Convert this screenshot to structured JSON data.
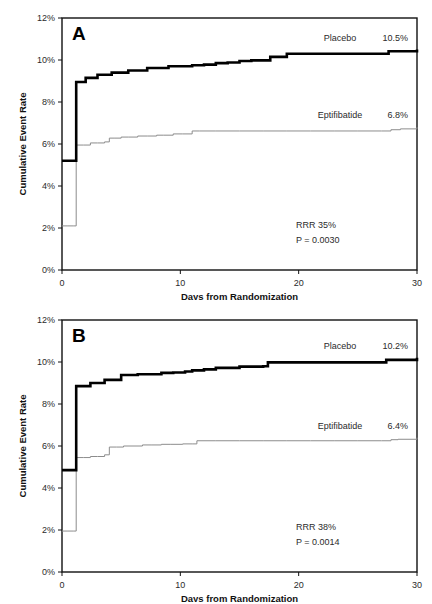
{
  "figure": {
    "axis": {
      "x_label": "Days from Randomization",
      "y_label": "Cumulative Event Rate",
      "x_ticks": [
        "0",
        "10",
        "20",
        "30"
      ],
      "y_ticks": [
        "0%",
        "2%",
        "4%",
        "6%",
        "8%",
        "10%",
        "12%"
      ]
    },
    "colors": {
      "placebo_line": "#000000",
      "eptifibatide_line": "#8c8c8c",
      "frame": "#111111",
      "text": "#2b2b2b"
    },
    "panels": [
      {
        "letter": "A",
        "placebo_label": "Placebo",
        "placebo_value": "10.5%",
        "drug_label": "Eptifibatide",
        "drug_value": "6.8%",
        "rrr": "RRR 35%",
        "pvalue": "P = 0.0030"
      },
      {
        "letter": "B",
        "placebo_label": "Placebo",
        "placebo_value": "10.2%",
        "drug_label": "Eptifibatide",
        "drug_value": "6.4%",
        "rrr": "RRR 38%",
        "pvalue": "P = 0.0014"
      }
    ]
  },
  "chart_data": [
    {
      "type": "line",
      "title": "A",
      "xlabel": "Days from Randomization",
      "ylabel": "Cumulative Event Rate",
      "xlim": [
        0,
        30
      ],
      "ylim": [
        0,
        12
      ],
      "x_ticks": [
        0,
        10,
        20,
        30
      ],
      "y_ticks": [
        0,
        2,
        4,
        6,
        8,
        10,
        12
      ],
      "grid": false,
      "legend_position": "inline-right",
      "annotations": [
        "RRR 35%",
        "P = 0.0030"
      ],
      "series": [
        {
          "name": "Placebo",
          "final_value": 10.5,
          "style": "step-thick-black",
          "x": [
            0,
            0.5,
            1,
            1.2,
            1.6,
            2,
            2.5,
            3,
            3.6,
            4.2,
            5,
            5.6,
            6.4,
            7.2,
            8.2,
            9,
            10,
            11,
            12,
            13,
            14,
            15,
            16,
            17,
            17.6,
            18.4,
            19,
            21,
            23,
            25,
            27,
            27.6,
            29,
            30
          ],
          "y": [
            5.2,
            5.2,
            5.2,
            8.95,
            8.95,
            9.15,
            9.15,
            9.3,
            9.3,
            9.4,
            9.4,
            9.5,
            9.5,
            9.62,
            9.62,
            9.7,
            9.7,
            9.75,
            9.78,
            9.85,
            9.88,
            9.95,
            9.98,
            9.98,
            10.15,
            10.15,
            10.3,
            10.3,
            10.3,
            10.3,
            10.3,
            10.42,
            10.42,
            10.5
          ]
        },
        {
          "name": "Eptifibatide",
          "final_value": 6.8,
          "style": "step-thin-gray",
          "x": [
            0,
            0.5,
            1,
            1.2,
            1.8,
            2.4,
            3,
            3.6,
            4,
            4.4,
            5,
            5.6,
            6.4,
            7.2,
            8,
            8.6,
            9.4,
            10.2,
            11,
            11.6,
            13,
            15,
            17,
            19,
            21,
            23,
            25,
            27,
            27.8,
            28.6,
            30
          ],
          "y": [
            2.1,
            2.1,
            2.1,
            5.95,
            5.95,
            6.05,
            6.05,
            6.1,
            6.28,
            6.28,
            6.33,
            6.33,
            6.38,
            6.38,
            6.42,
            6.42,
            6.48,
            6.48,
            6.62,
            6.62,
            6.62,
            6.62,
            6.62,
            6.62,
            6.62,
            6.62,
            6.62,
            6.62,
            6.68,
            6.72,
            6.8
          ]
        }
      ]
    },
    {
      "type": "line",
      "title": "B",
      "xlabel": "Days from Randomization",
      "ylabel": "Cumulative Event Rate",
      "xlim": [
        0,
        30
      ],
      "ylim": [
        0,
        12
      ],
      "x_ticks": [
        0,
        10,
        20,
        30
      ],
      "y_ticks": [
        0,
        2,
        4,
        6,
        8,
        10,
        12
      ],
      "grid": false,
      "legend_position": "inline-right",
      "annotations": [
        "RRR 38%",
        "P = 0.0014"
      ],
      "series": [
        {
          "name": "Placebo",
          "final_value": 10.2,
          "style": "step-thick-black",
          "x": [
            0,
            0.5,
            1,
            1.2,
            1.8,
            2.4,
            3,
            3.6,
            4.2,
            5,
            5.6,
            6.4,
            7.4,
            8.4,
            9.4,
            10.4,
            11,
            12,
            13,
            14,
            15,
            16,
            17,
            17.4,
            19,
            21,
            23,
            25,
            26.8,
            27.4,
            29,
            30
          ],
          "y": [
            4.85,
            4.85,
            4.85,
            8.85,
            8.85,
            9.0,
            9.0,
            9.15,
            9.15,
            9.38,
            9.38,
            9.42,
            9.42,
            9.48,
            9.5,
            9.55,
            9.6,
            9.65,
            9.72,
            9.72,
            9.78,
            9.78,
            9.8,
            9.98,
            9.98,
            9.98,
            9.98,
            9.98,
            9.98,
            10.1,
            10.1,
            10.2
          ]
        },
        {
          "name": "Eptifibatide",
          "final_value": 6.4,
          "style": "step-thin-gray",
          "x": [
            0,
            0.5,
            1,
            1.2,
            1.8,
            2.4,
            3,
            3.6,
            4,
            4.6,
            5.2,
            6,
            6.8,
            7.6,
            8.4,
            9.2,
            10.2,
            11,
            11.4,
            13,
            15,
            17,
            19,
            21,
            23,
            25,
            27,
            27.8,
            28.4,
            30
          ],
          "y": [
            1.95,
            1.95,
            1.95,
            5.45,
            5.45,
            5.5,
            5.5,
            5.58,
            5.95,
            5.95,
            6.0,
            6.0,
            6.05,
            6.05,
            6.08,
            6.08,
            6.1,
            6.1,
            6.25,
            6.25,
            6.25,
            6.25,
            6.25,
            6.25,
            6.25,
            6.25,
            6.25,
            6.3,
            6.32,
            6.4
          ]
        }
      ]
    }
  ]
}
